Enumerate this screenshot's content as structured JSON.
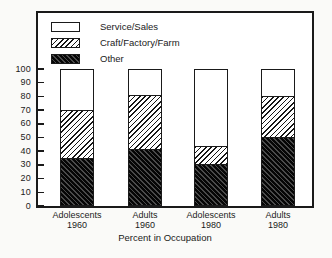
{
  "chart_data": {
    "type": "bar",
    "stacked": true,
    "title": "",
    "xlabel": "Percent in Occupation",
    "ylabel": "",
    "ylim": [
      0,
      100
    ],
    "yticks": [
      0,
      10,
      20,
      30,
      40,
      50,
      60,
      70,
      80,
      90,
      100
    ],
    "grid": false,
    "legend_position": "top-left-inside",
    "categories": [
      {
        "line1": "Adolescents",
        "line2": "1960"
      },
      {
        "line1": "Adults",
        "line2": "1960"
      },
      {
        "line1": "Adolescents",
        "line2": "1980"
      },
      {
        "line1": "Adults",
        "line2": "1980"
      }
    ],
    "series": [
      {
        "name": "Other",
        "pattern": "dark-backslash-hatch",
        "values": [
          34,
          41,
          30,
          50
        ]
      },
      {
        "name": "Craft/Factory/Farm",
        "pattern": "light-slash-hatch",
        "values": [
          36,
          40,
          13,
          30
        ]
      },
      {
        "name": "Service/Sales",
        "pattern": "white",
        "values": [
          30,
          19,
          57,
          20
        ]
      }
    ],
    "legend_order_top_to_bottom": [
      "Service/Sales",
      "Craft/Factory/Farm",
      "Other"
    ]
  },
  "colors": {
    "ink": "#1a1a1a",
    "plot_background": "#ffffff",
    "page_background": "#fafaf8"
  }
}
